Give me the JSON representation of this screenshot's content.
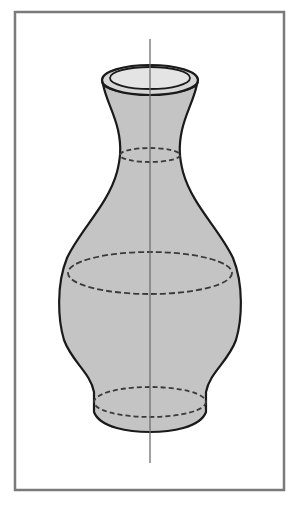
{
  "figure": {
    "title": "Vase solid of revolution",
    "colors": {
      "background": "#ffffff",
      "frame": "#7a7a7a",
      "fill": "#c4c4c4",
      "rim_fill": "#d6d6d6",
      "inner_rim_fill": "#e4e4e4",
      "outline": "#1a1a1a",
      "dashed": "#3a3a3a",
      "axis": "#6f6f6f"
    },
    "frame": {
      "x": 15,
      "y": 12,
      "width": 269,
      "height": 478
    },
    "axis": {
      "x": 150,
      "y1": 39,
      "y2": 463
    },
    "cross_sections": [
      {
        "name": "neck",
        "cx": 150,
        "cy": 155,
        "rx": 30,
        "ry": 7
      },
      {
        "name": "belly",
        "cx": 150,
        "cy": 273,
        "rx": 82,
        "ry": 21
      },
      {
        "name": "foot",
        "cx": 150,
        "cy": 402,
        "rx": 56,
        "ry": 15
      }
    ],
    "rim": {
      "outer": {
        "cx": 150,
        "cy": 80,
        "rx": 48,
        "ry": 15
      },
      "inner": {
        "cx": 150,
        "cy": 78,
        "rx": 40,
        "ry": 11
      }
    }
  }
}
